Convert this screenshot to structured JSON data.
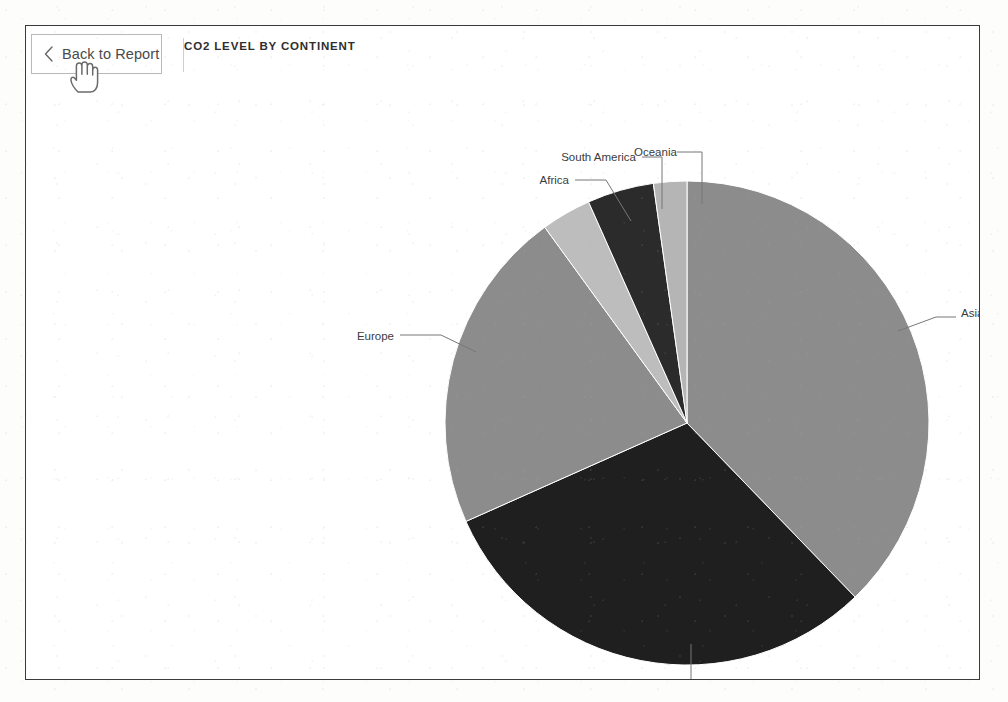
{
  "header": {
    "back_button_label": "Back to Report",
    "back_icon": "chevron-left-icon",
    "title": "CO2 LEVEL BY CONTINENT"
  },
  "cursor": {
    "type": "pointing-hand-cursor"
  },
  "chart_data": {
    "type": "pie",
    "title": "CO2 LEVEL BY CONTINENT",
    "xlabel": "",
    "ylabel": "",
    "legend_position": "none",
    "labels_position": "outside-with-leader-lines",
    "grid": false,
    "categories": [
      "Asia",
      "North America",
      "Europe",
      "Africa",
      "South America",
      "Oceania"
    ],
    "values": [
      37.8,
      30.6,
      21.7,
      3.3,
      4.4,
      2.2
    ],
    "slices": [
      {
        "label": "Asia",
        "value": 37.8,
        "start_angle": 0,
        "end_angle": 136,
        "color": "#8c8c8c"
      },
      {
        "label": "North America",
        "value": 30.6,
        "start_angle": 136,
        "end_angle": 246,
        "color": "#1f1f1f"
      },
      {
        "label": "Europe",
        "value": 21.7,
        "start_angle": 246,
        "end_angle": 324,
        "color": "#8c8c8c"
      },
      {
        "label": "Africa",
        "value": 3.3,
        "start_angle": 324,
        "end_angle": 336,
        "color": "#bdbdbd"
      },
      {
        "label": "South America",
        "value": 4.4,
        "start_angle": 336,
        "end_angle": 352,
        "color": "#2b2b2b"
      },
      {
        "label": "Oceania",
        "value": 2.2,
        "start_angle": 352,
        "end_angle": 360,
        "color": "#b5b5b5"
      }
    ]
  },
  "colors": {
    "frame_border": "#3a3a3a",
    "slice_gray": "#8c8c8c",
    "slice_dark": "#1f1f1f",
    "slice_light": "#bdbdbd",
    "label_text": "#3c3c3c",
    "leader_line": "#777777"
  }
}
